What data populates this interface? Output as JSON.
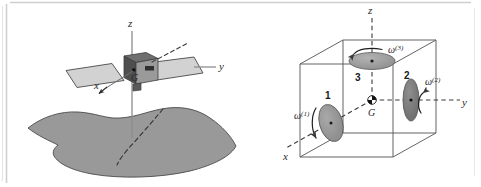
{
  "figure": {
    "title": "",
    "colors": {
      "terrain_fill": "#999999",
      "terrain_stroke": "#4a4a4a",
      "panel_fill": "#d2d2d2",
      "panel_stroke": "#4a4a4a",
      "body_dark": "#4f4f4f",
      "body_mid": "#7a7a7a",
      "body_light": "#9e9e9e",
      "disc_fill": "#8d8d8d",
      "disc_stroke": "#5a5a5a",
      "axis_line": "#6e6e6e",
      "dashed_line": "#3a3a3a",
      "cube_stroke": "#5c5c5c",
      "frame_stroke": "#cfcfcf",
      "text": "#2a2a2a"
    }
  },
  "left_panel": {
    "name": "satellite-over-earth",
    "axes": [
      {
        "id": "z",
        "label": "z",
        "orientation": "vertical-up"
      },
      {
        "id": "y",
        "label": "y",
        "orientation": "horizontal-right"
      },
      {
        "id": "x",
        "label": "x",
        "orientation": "diagonal-down-left"
      }
    ],
    "center_label": "G",
    "body_label": "satellite-body",
    "panels": [
      "solar-panel-left",
      "solar-panel-right"
    ],
    "ground_label": "earth-surface",
    "ground_track_label": "orbit-ground-track"
  },
  "right_panel": {
    "name": "reaction-wheel-cube",
    "axes": [
      {
        "id": "z",
        "label": "z",
        "orientation": "vertical-up"
      },
      {
        "id": "y",
        "label": "y",
        "orientation": "horizontal-right"
      },
      {
        "id": "x",
        "label": "x",
        "orientation": "diagonal-down-left"
      }
    ],
    "center_label": "G",
    "wheels": [
      {
        "number": "1",
        "omega": "ω",
        "omega_sup": "(1)",
        "axis": "x",
        "name": "reaction-wheel-1"
      },
      {
        "number": "2",
        "omega": "ω",
        "omega_sup": "(2)",
        "axis": "y",
        "name": "reaction-wheel-2"
      },
      {
        "number": "3",
        "omega": "ω",
        "omega_sup": "(3)",
        "axis": "z",
        "name": "reaction-wheel-3"
      }
    ]
  }
}
